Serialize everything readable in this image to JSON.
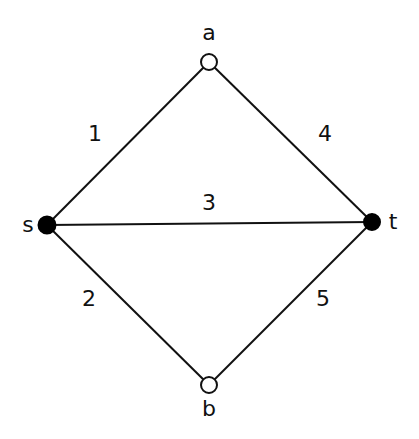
{
  "graph": {
    "nodes": [
      {
        "id": "a",
        "label": "a",
        "x": 209,
        "y": 62,
        "filled": false,
        "label_x": 209,
        "label_y": 40
      },
      {
        "id": "s",
        "label": "s",
        "x": 47,
        "y": 225,
        "filled": true,
        "label_x": 28,
        "label_y": 232
      },
      {
        "id": "t",
        "label": "t",
        "x": 372,
        "y": 222,
        "filled": true,
        "label_x": 393,
        "label_y": 229
      },
      {
        "id": "b",
        "label": "b",
        "x": 209,
        "y": 385,
        "filled": false,
        "label_x": 209,
        "label_y": 416
      }
    ],
    "edges": [
      {
        "from": "s",
        "to": "a",
        "label": "1",
        "label_x": 95,
        "label_y": 141
      },
      {
        "from": "s",
        "to": "b",
        "label": "2",
        "label_x": 89,
        "label_y": 306
      },
      {
        "from": "s",
        "to": "t",
        "label": "3",
        "label_x": 209,
        "label_y": 210
      },
      {
        "from": "a",
        "to": "t",
        "label": "4",
        "label_x": 325,
        "label_y": 141
      },
      {
        "from": "b",
        "to": "t",
        "label": "5",
        "label_x": 323,
        "label_y": 306
      }
    ]
  },
  "colors": {
    "stroke": "#111111",
    "filled_node": "#000000",
    "open_node": "#ffffff",
    "background": "#ffffff"
  }
}
